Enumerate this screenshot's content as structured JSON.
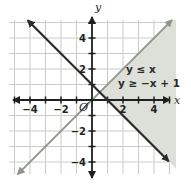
{
  "colors": {
    "background": "#ffffff",
    "region": "#dce0d8",
    "grid": "#c7cec5",
    "line_gray": "#8d948d",
    "line_dark": "#2a2a2a",
    "axis": "#1f1f1f",
    "text": "#222222"
  },
  "chart_data": {
    "type": "line",
    "title": "",
    "xlabel": "x",
    "ylabel": "y",
    "origin_label": "O",
    "xlim": [
      -5.4,
      5.4
    ],
    "ylim": [
      -4.8,
      5.2
    ],
    "grid": true,
    "minor_tick_step": 1,
    "x_ticks": [
      {
        "v": -4,
        "label": "−4"
      },
      {
        "v": -2,
        "label": "−2"
      },
      {
        "v": 2,
        "label": "2"
      },
      {
        "v": 4,
        "label": "4"
      }
    ],
    "y_ticks": [
      {
        "v": 4,
        "label": "4"
      },
      {
        "v": 2,
        "label": "2"
      },
      {
        "v": -2,
        "label": "−2"
      },
      {
        "v": -4,
        "label": "−4"
      }
    ],
    "series": [
      {
        "name": "boundary-y-equals-x",
        "equation": "y = x",
        "slope": 1,
        "intercept": 0,
        "color_key": "line_gray",
        "width": 1.8,
        "endpoints": [
          [
            -4.8,
            -4.8
          ],
          [
            5.16,
            5.16
          ]
        ]
      },
      {
        "name": "boundary-y-equals-minus-x-plus-1",
        "equation": "y = −x + 1",
        "slope": -1,
        "intercept": 1,
        "color_key": "line_dark",
        "width": 2.2,
        "endpoints": [
          [
            -4.15,
            5.15
          ],
          [
            4.95,
            -3.95
          ]
        ]
      }
    ],
    "inequalities": [
      "y ≤ x",
      "y ≥ −x + 1"
    ],
    "annotations": [
      {
        "text": "y ≤ x",
        "at": [
          3.16,
          1.94
        ]
      },
      {
        "text": "y ≥ −x + 1",
        "at": [
          3.68,
          1.06
        ]
      }
    ],
    "shaded_region": {
      "description": "solution region where y ≤ x and y ≥ −x + 1",
      "bounded_by": [
        "y = x",
        "y = −x + 1"
      ],
      "vertex": [
        0.5,
        0.5
      ],
      "color_key": "region"
    }
  }
}
